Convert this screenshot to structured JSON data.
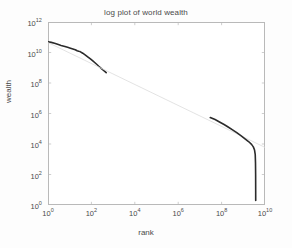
{
  "chart_data": {
    "type": "line",
    "title": "log plot of world wealth",
    "xlabel": "rank",
    "ylabel": "wealth",
    "xscale": "log",
    "yscale": "log",
    "xlim": [
      1,
      10000000000
    ],
    "ylim": [
      1,
      1000000000000
    ],
    "grid": false,
    "legend": null,
    "xticks": [
      {
        "value": 1,
        "label": "10",
        "exp": "0"
      },
      {
        "value": 100,
        "label": "10",
        "exp": "2"
      },
      {
        "value": 10000,
        "label": "10",
        "exp": "4"
      },
      {
        "value": 1000000,
        "label": "10",
        "exp": "6"
      },
      {
        "value": 100000000,
        "label": "10",
        "exp": "8"
      },
      {
        "value": 10000000000,
        "label": "10",
        "exp": "10"
      }
    ],
    "yticks": [
      {
        "value": 1,
        "label": "10",
        "exp": "0"
      },
      {
        "value": 100,
        "label": "10",
        "exp": "2"
      },
      {
        "value": 10000,
        "label": "10",
        "exp": "4"
      },
      {
        "value": 1000000,
        "label": "10",
        "exp": "6"
      },
      {
        "value": 100000000,
        "label": "10",
        "exp": "8"
      },
      {
        "value": 10000000000,
        "label": "10",
        "exp": "10"
      },
      {
        "value": 1000000000000,
        "label": "10",
        "exp": "12"
      }
    ],
    "series": [
      {
        "name": "world wealth distribution",
        "style": "thick-dark-solid",
        "color": "#2b2b2b",
        "width": 1.6,
        "points": [
          [
            1,
            50000000000.0
          ],
          [
            1.4,
            46000000000.0
          ],
          [
            2,
            40000000000.0
          ],
          [
            3,
            33000000000.0
          ],
          [
            4,
            29000000000.0
          ],
          [
            6,
            25000000000.0
          ],
          [
            8,
            22000000000.0
          ],
          [
            10,
            20000000000.0
          ],
          [
            14,
            17000000000.0
          ],
          [
            18,
            15000000000.0
          ],
          [
            22,
            13000000000.0
          ],
          [
            26,
            12000000000.0
          ],
          [
            30,
            11500000000.0
          ],
          [
            40,
            9000000000.0
          ],
          [
            55,
            6500000000.0
          ],
          [
            70,
            5000000000.0
          ],
          [
            90,
            3800000000.0
          ],
          [
            120,
            2700000000.0
          ],
          [
            160,
            1900000000.0
          ],
          [
            220,
            1250000000.0
          ],
          [
            300,
            850000000.0
          ],
          [
            400,
            600000000.0
          ],
          [
            480,
            480000000.0
          ]
        ]
      },
      {
        "name": "power-law reference line",
        "style": "thin-faint-solid",
        "color": "#dcdcdc",
        "width": 0.8,
        "points": [
          [
            1,
            45000000000.0
          ],
          [
            10000000000,
            6000.0
          ]
        ]
      },
      {
        "name": "world wealth distribution tail",
        "style": "thick-dark-solid",
        "color": "#2b2b2b",
        "width": 1.6,
        "points": [
          [
            30000000.0,
            550000.0
          ],
          [
            50000000.0,
            400000.0
          ],
          [
            80000000.0,
            280000.0
          ],
          [
            130000000.0,
            190000.0
          ],
          [
            200000000.0,
            130000.0
          ],
          [
            320000000.0,
            85000.0
          ],
          [
            500000000.0,
            55000.0
          ],
          [
            800000000.0,
            34000.0
          ],
          [
            1200000000.0,
            22000.0
          ],
          [
            1800000000.0,
            14000.0
          ],
          [
            2400000000.0,
            9500.0
          ],
          [
            2900000000.0,
            6500.0
          ],
          [
            3300000000.0,
            4000.0
          ],
          [
            3550000000.0,
            2000.0
          ],
          [
            3650000000.0,
            600.0
          ],
          [
            3700000000.0,
            100.0
          ],
          [
            3720000000.0,
            10.0
          ],
          [
            3730000000.0,
            2.0
          ]
        ]
      }
    ]
  },
  "axes": {
    "title": "log plot of world wealth",
    "xaxis_title": "rank",
    "yaxis_title": "wealth"
  },
  "colors": {
    "axis": "#b9b9b9",
    "data": "#2b2b2b",
    "reference": "#dcdcdc",
    "text": "#4a4a4a",
    "background": "#fdfdfd",
    "plot_background": "#ffffff"
  }
}
